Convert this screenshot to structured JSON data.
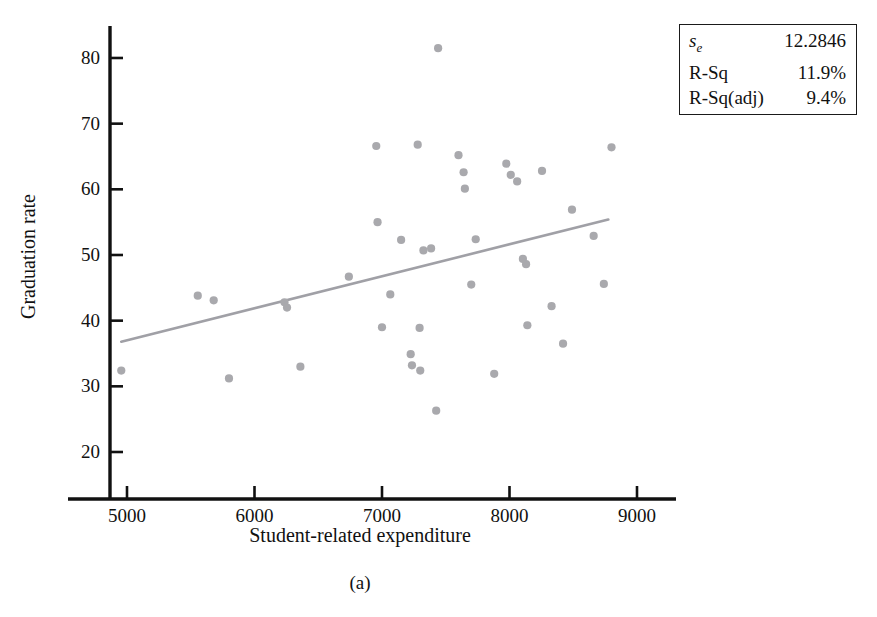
{
  "figure": {
    "caption": "(a)"
  },
  "chart_data": {
    "type": "scatter",
    "title": "",
    "xlabel": "Student-related expenditure",
    "ylabel": "Graduation rate",
    "xlim": [
      4600,
      9350
    ],
    "ylim": [
      15.5,
      84.5
    ],
    "xticks": [
      5000,
      6000,
      7000,
      8000,
      9000
    ],
    "yticks": [
      20,
      30,
      40,
      50,
      60,
      70,
      80
    ],
    "xtick_labels": [
      "5000",
      "6000",
      "7000",
      "8000",
      "9000"
    ],
    "ytick_labels": [
      "20",
      "30",
      "40",
      "50",
      "60",
      "70",
      "80"
    ],
    "grid": false,
    "legend": null,
    "marker_color": "#a9a9ad",
    "line_color": "#a0a0a6",
    "axis_color": "#111111",
    "points": [
      {
        "x": 4955,
        "y": 32.4
      },
      {
        "x": 5555,
        "y": 43.8
      },
      {
        "x": 5680,
        "y": 43.1
      },
      {
        "x": 5800,
        "y": 31.2
      },
      {
        "x": 6235,
        "y": 42.8
      },
      {
        "x": 6255,
        "y": 42.0
      },
      {
        "x": 6360,
        "y": 33.0
      },
      {
        "x": 6740,
        "y": 46.7
      },
      {
        "x": 6955,
        "y": 66.6
      },
      {
        "x": 6965,
        "y": 55.0
      },
      {
        "x": 7000,
        "y": 39.0
      },
      {
        "x": 7065,
        "y": 44.0
      },
      {
        "x": 7150,
        "y": 52.3
      },
      {
        "x": 7225,
        "y": 34.9
      },
      {
        "x": 7235,
        "y": 33.2
      },
      {
        "x": 7280,
        "y": 66.8
      },
      {
        "x": 7295,
        "y": 38.9
      },
      {
        "x": 7300,
        "y": 32.4
      },
      {
        "x": 7325,
        "y": 50.7
      },
      {
        "x": 7385,
        "y": 51.0
      },
      {
        "x": 7425,
        "y": 26.3
      },
      {
        "x": 7440,
        "y": 81.5
      },
      {
        "x": 7600,
        "y": 65.2
      },
      {
        "x": 7640,
        "y": 62.6
      },
      {
        "x": 7650,
        "y": 60.1
      },
      {
        "x": 7700,
        "y": 45.5
      },
      {
        "x": 7735,
        "y": 52.4
      },
      {
        "x": 7880,
        "y": 31.9
      },
      {
        "x": 7975,
        "y": 63.9
      },
      {
        "x": 8010,
        "y": 62.2
      },
      {
        "x": 8060,
        "y": 61.2
      },
      {
        "x": 8105,
        "y": 49.4
      },
      {
        "x": 8130,
        "y": 48.6
      },
      {
        "x": 8140,
        "y": 39.3
      },
      {
        "x": 8255,
        "y": 62.8
      },
      {
        "x": 8330,
        "y": 42.2
      },
      {
        "x": 8420,
        "y": 36.5
      },
      {
        "x": 8490,
        "y": 56.9
      },
      {
        "x": 8660,
        "y": 52.9
      },
      {
        "x": 8740,
        "y": 45.6
      },
      {
        "x": 8800,
        "y": 66.4
      }
    ],
    "regression_line": {
      "x_start": 4955,
      "y_start": 36.8,
      "x_end": 8775,
      "y_end": 55.4
    }
  },
  "stats_box": {
    "rows": [
      {
        "name": "s",
        "sub": "e",
        "value": "12.2846",
        "italic": true
      },
      {
        "name": "R-Sq",
        "sub": "",
        "value": "11.9%",
        "italic": false
      },
      {
        "name": "R-Sq(adj)",
        "sub": "",
        "value": "9.4%",
        "italic": false
      }
    ]
  }
}
